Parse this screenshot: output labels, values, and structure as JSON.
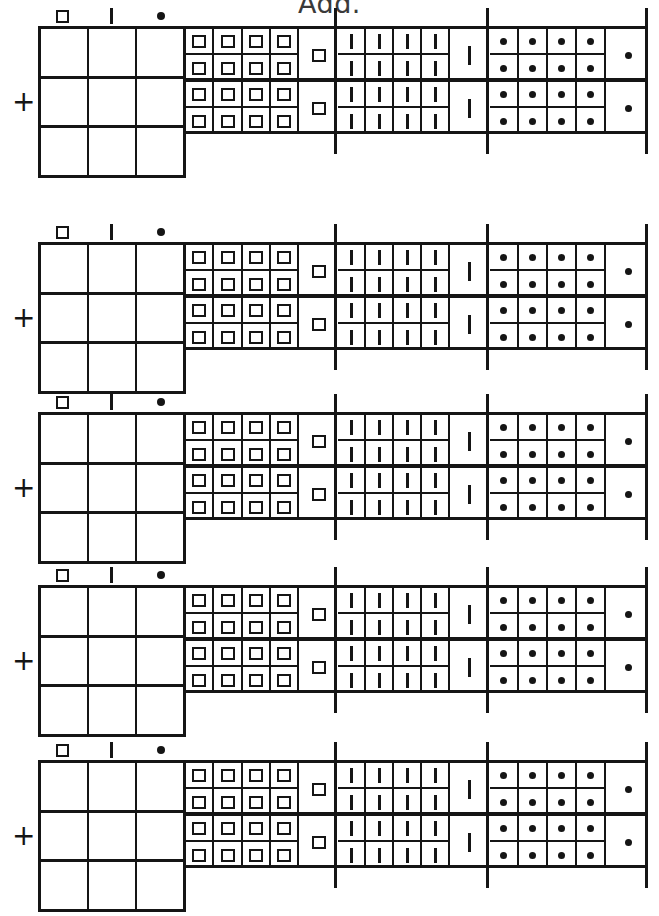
{
  "title": "Add.",
  "symbols": {
    "hundreds": "square-glyph",
    "tens": "bar-glyph",
    "units": "dot-glyph",
    "plus": "+"
  },
  "place_header": [
    {
      "name": "hundreds",
      "glyph": "square-glyph"
    },
    {
      "name": "tens",
      "glyph": "bar-glyph"
    },
    {
      "name": "units",
      "glyph": "dot-glyph"
    }
  ],
  "colors": {
    "ink": "#151515",
    "paper": "#ffffff",
    "title": "#3a3a3a"
  },
  "layout": {
    "answer_grid_rows": 3,
    "answer_grid_cols": 3,
    "sections": [
      "squares",
      "bars",
      "dots"
    ],
    "pair_columns_per_section": 4,
    "wide_column_per_section": 1
  },
  "problems": [
    {
      "id": "problem-1",
      "addend_top": {
        "squares": {
          "pairs": [
            2,
            2,
            2,
            2
          ],
          "wide": 1,
          "total": 9
        },
        "bars": {
          "pairs": [
            2,
            2,
            2,
            2
          ],
          "wide": 1,
          "total": 9
        },
        "dots": {
          "pairs": [
            2,
            2,
            2,
            2
          ],
          "wide": 1,
          "total": 9
        }
      },
      "addend_bottom": {
        "squares": {
          "pairs": [
            2,
            2,
            2,
            2
          ],
          "wide": 1,
          "total": 9
        },
        "bars": {
          "pairs": [
            2,
            2,
            2,
            2
          ],
          "wide": 1,
          "total": 9
        },
        "dots": {
          "pairs": [
            2,
            2,
            2,
            2
          ],
          "wide": 1,
          "total": 9
        }
      },
      "answer": {
        "hundreds": "",
        "tens": "",
        "units": ""
      }
    },
    {
      "id": "problem-2",
      "addend_top": {
        "squares": {
          "pairs": [
            2,
            2,
            2,
            2
          ],
          "wide": 1,
          "total": 9
        },
        "bars": {
          "pairs": [
            2,
            2,
            2,
            2
          ],
          "wide": 1,
          "total": 9
        },
        "dots": {
          "pairs": [
            2,
            2,
            2,
            2
          ],
          "wide": 1,
          "total": 9
        }
      },
      "addend_bottom": {
        "squares": {
          "pairs": [
            2,
            2,
            2,
            2
          ],
          "wide": 1,
          "total": 9
        },
        "bars": {
          "pairs": [
            2,
            2,
            2,
            2
          ],
          "wide": 1,
          "total": 9
        },
        "dots": {
          "pairs": [
            2,
            2,
            2,
            2
          ],
          "wide": 1,
          "total": 9
        }
      },
      "answer": {
        "hundreds": "",
        "tens": "",
        "units": ""
      }
    },
    {
      "id": "problem-3",
      "addend_top": {
        "squares": {
          "pairs": [
            2,
            2,
            2,
            2
          ],
          "wide": 1,
          "total": 9
        },
        "bars": {
          "pairs": [
            2,
            2,
            2,
            2
          ],
          "wide": 1,
          "total": 9
        },
        "dots": {
          "pairs": [
            2,
            2,
            2,
            2
          ],
          "wide": 1,
          "total": 9
        }
      },
      "addend_bottom": {
        "squares": {
          "pairs": [
            2,
            2,
            2,
            2
          ],
          "wide": 1,
          "total": 9
        },
        "bars": {
          "pairs": [
            2,
            2,
            2,
            2
          ],
          "wide": 1,
          "total": 9
        },
        "dots": {
          "pairs": [
            2,
            2,
            2,
            2
          ],
          "wide": 1,
          "total": 9
        }
      },
      "answer": {
        "hundreds": "",
        "tens": "",
        "units": ""
      }
    },
    {
      "id": "problem-4",
      "addend_top": {
        "squares": {
          "pairs": [
            2,
            2,
            2,
            2
          ],
          "wide": 1,
          "total": 9
        },
        "bars": {
          "pairs": [
            2,
            2,
            2,
            2
          ],
          "wide": 1,
          "total": 9
        },
        "dots": {
          "pairs": [
            2,
            2,
            2,
            2
          ],
          "wide": 1,
          "total": 9
        }
      },
      "addend_bottom": {
        "squares": {
          "pairs": [
            2,
            2,
            2,
            2
          ],
          "wide": 1,
          "total": 9
        },
        "bars": {
          "pairs": [
            2,
            2,
            2,
            2
          ],
          "wide": 1,
          "total": 9
        },
        "dots": {
          "pairs": [
            2,
            2,
            2,
            2
          ],
          "wide": 1,
          "total": 9
        }
      },
      "answer": {
        "hundreds": "",
        "tens": "",
        "units": ""
      }
    },
    {
      "id": "problem-5",
      "addend_top": {
        "squares": {
          "pairs": [
            2,
            2,
            2,
            2
          ],
          "wide": 1,
          "total": 9
        },
        "bars": {
          "pairs": [
            2,
            2,
            2,
            2
          ],
          "wide": 1,
          "total": 9
        },
        "dots": {
          "pairs": [
            2,
            2,
            2,
            2
          ],
          "wide": 1,
          "total": 9
        }
      },
      "addend_bottom": {
        "squares": {
          "pairs": [
            2,
            2,
            2,
            2
          ],
          "wide": 1,
          "total": 9
        },
        "bars": {
          "pairs": [
            2,
            2,
            2,
            2
          ],
          "wide": 1,
          "total": 9
        },
        "dots": {
          "pairs": [
            2,
            2,
            2,
            2
          ],
          "wide": 1,
          "total": 9
        }
      },
      "answer": {
        "hundreds": "",
        "tens": "",
        "units": ""
      }
    }
  ],
  "block_tops": [
    6,
    222,
    392,
    565,
    740
  ]
}
